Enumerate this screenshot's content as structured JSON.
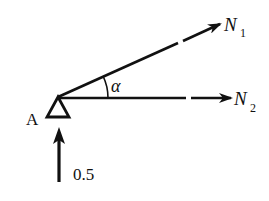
{
  "diagram": {
    "type": "free-body-diagram",
    "node": {
      "label": "A",
      "support": "pin-support-triangle"
    },
    "forces": [
      {
        "name": "N",
        "subscript": "1",
        "direction": "inclined-up-right",
        "angle_label": "α"
      },
      {
        "name": "N",
        "subscript": "2",
        "direction": "horizontal-right"
      },
      {
        "name": "0.5",
        "direction": "vertical-up"
      }
    ],
    "angle": {
      "symbol": "α",
      "between": [
        "N1",
        "N2"
      ]
    }
  },
  "labels": {
    "node_a": "A",
    "n1_main": "N",
    "n1_sub": "1",
    "n2_main": "N",
    "n2_sub": "2",
    "alpha": "α",
    "reaction_value": "0.5"
  },
  "colors": {
    "stroke": "#111111",
    "background": "#ffffff"
  }
}
